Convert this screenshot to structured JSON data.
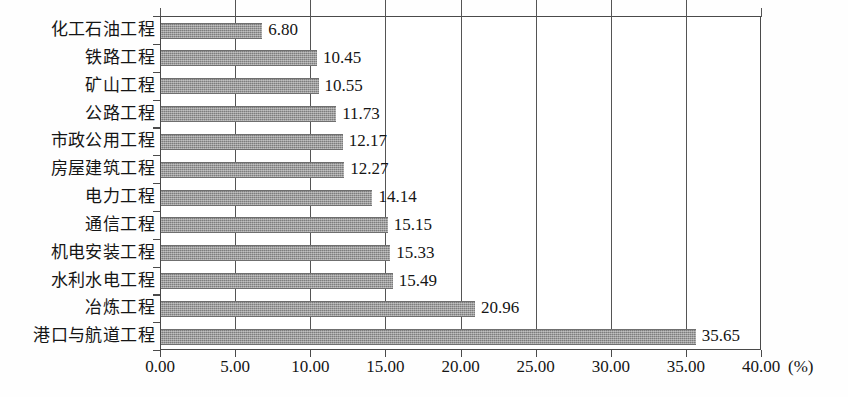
{
  "chart_data": {
    "type": "bar",
    "orientation": "horizontal",
    "title": "",
    "subtitle": "",
    "xlabel": "(%)",
    "ylabel": "",
    "xlim": [
      0,
      40
    ],
    "xticks": [
      "0.00",
      "5.00",
      "10.00",
      "15.00",
      "20.00",
      "25.00",
      "30.00",
      "35.00",
      "40.00"
    ],
    "xtick_values": [
      0,
      5,
      10,
      15,
      20,
      25,
      30,
      35,
      40
    ],
    "grid": "vertical",
    "legend": "none",
    "bar_color": "#8c8c8c",
    "categories": [
      "化工石油工程",
      "铁路工程",
      "矿山工程",
      "公路工程",
      "市政公用工程",
      "房屋建筑工程",
      "电力工程",
      "通信工程",
      "机电安装工程",
      "水利水电工程",
      "冶炼工程",
      "港口与航道工程"
    ],
    "values": [
      6.8,
      10.45,
      10.55,
      11.73,
      12.17,
      12.27,
      14.14,
      15.15,
      15.33,
      15.49,
      20.96,
      35.65
    ],
    "value_labels": [
      "6.80",
      "10.45",
      "10.55",
      "11.73",
      "12.17",
      "12.27",
      "14.14",
      "15.15",
      "15.33",
      "15.49",
      "20.96",
      "35.65"
    ]
  }
}
